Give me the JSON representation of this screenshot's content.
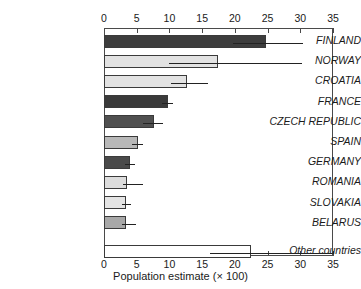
{
  "chart_data": {
    "type": "bar",
    "orientation": "horizontal",
    "title": "",
    "xlabel": "Population estimate (× 100)",
    "ylabel": "",
    "xlim": [
      0,
      35
    ],
    "xticks": [
      0,
      5,
      10,
      15,
      20,
      25,
      30,
      35
    ],
    "xtick_labels": [
      "0",
      "5",
      "10",
      "15",
      "20",
      "25",
      "30",
      "35"
    ],
    "axis_top": true,
    "axis_bottom": true,
    "grid": false,
    "legend": "none",
    "categories": [
      "FINLAND",
      "NORWAY",
      "CROATIA",
      "FRANCE",
      "CZECH REPUBLIC",
      "SPAIN",
      "GERMANY",
      "ROMANIA",
      "SLOVAKIA",
      "BELARUS",
      "Other countries"
    ],
    "values": [
      24.8,
      17.4,
      12.7,
      9.8,
      7.7,
      5.2,
      4.0,
      3.5,
      3.4,
      3.4,
      22.5
    ],
    "error_low": [
      19.7,
      10.0,
      10.2,
      8.8,
      6.0,
      4.3,
      3.2,
      2.9,
      2.8,
      2.7,
      16.2
    ],
    "error_high": [
      30.4,
      30.3,
      15.9,
      10.6,
      9.0,
      5.9,
      4.8,
      6.0,
      4.1,
      4.9,
      34.9
    ],
    "bar_colors": [
      "#3d3d3d",
      "#e2e2e2",
      "#e2e2e2",
      "#3a3a3a",
      "#505050",
      "#b8b8b8",
      "#4a4a4a",
      "#dcdcdc",
      "#e4e4e4",
      "#a8a8a8",
      "#ffffff"
    ],
    "bar_edge_color": "#3a3a3a",
    "error_color": "#222222",
    "axis_color": "#4a4a4a",
    "text_color": "#1a1a1a"
  }
}
